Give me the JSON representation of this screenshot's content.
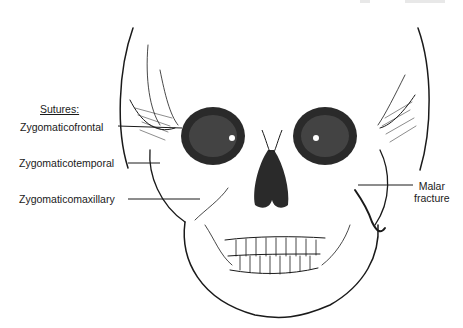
{
  "figure": {
    "labels": {
      "heading": "Sutures:",
      "zygomaticofrontal": "Zygomaticofrontal",
      "zygomaticotemporal": "Zygomaticotemporal",
      "zygomaticomaxillary": "Zygomaticomaxillary",
      "malar_line1": "Malar",
      "malar_line2": "fracture"
    },
    "colors": {
      "ink": "#1a1a1a",
      "background": "#ffffff"
    }
  }
}
